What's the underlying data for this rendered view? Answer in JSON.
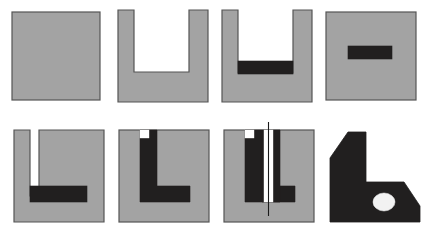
{
  "figure": {
    "width": 426,
    "height": 231,
    "background_color": "#ffffff",
    "rows": 2,
    "columns": 4
  },
  "colors": {
    "material_gray": "#a3a3a3",
    "cut_black": "#211f1f",
    "outline": "#555555",
    "void_white": "#ffffff",
    "hole_white": "#f2f2f2",
    "centerline": "#1a1a1a"
  },
  "panels": [
    {
      "index": 1,
      "name": "solid-block",
      "label": "",
      "shape": "square",
      "features": []
    },
    {
      "index": 2,
      "name": "open-slot-block",
      "label": "",
      "shape": "u-channel",
      "features": [
        "through-slot-open-top"
      ]
    },
    {
      "index": 3,
      "name": "slot-with-black-floor",
      "label": "",
      "shape": "u-channel",
      "features": [
        "through-slot-open-top",
        "black-floor-bar"
      ]
    },
    {
      "index": 4,
      "name": "hidden-internal-bar",
      "label": "",
      "shape": "square",
      "features": [
        "internal-black-bar"
      ]
    },
    {
      "index": 5,
      "name": "narrow-slot-with-bar",
      "label": "",
      "shape": "square",
      "features": [
        "narrow-vertical-slot",
        "black-horizontal-bar"
      ]
    },
    {
      "index": 6,
      "name": "l-shaped-black-cut",
      "label": "",
      "shape": "square",
      "features": [
        "black-l-section",
        "top-notch"
      ]
    },
    {
      "index": 7,
      "name": "sectioned-with-centerline",
      "label": "",
      "shape": "square",
      "features": [
        "black-l-section",
        "white-vertical-slot",
        "centerline"
      ]
    },
    {
      "index": 8,
      "name": "finished-bracket",
      "label": "",
      "shape": "chamfered-l-bracket",
      "features": [
        "chamfer-top-left",
        "chamfer-bottom-right",
        "round-hole"
      ]
    }
  ],
  "geometry": {
    "panel1": {
      "x": 12,
      "y": 12,
      "w": 88,
      "h": 88
    },
    "panel2": {
      "x": 118,
      "y": 10,
      "w": 90,
      "h": 92,
      "slot_left": 134,
      "slot_right": 189,
      "slot_bottom": 72
    },
    "panel3": {
      "x": 222,
      "y": 10,
      "w": 90,
      "h": 92,
      "slot_left": 238,
      "slot_right": 293,
      "slot_bottom": 73,
      "bar_top": 61
    },
    "panel4": {
      "x": 326,
      "y": 12,
      "w": 90,
      "h": 88,
      "bar_x": 348,
      "bar_y": 58,
      "bar_w": 44,
      "bar_h": 13
    },
    "panel5": {
      "x": 14,
      "y": 130,
      "w": 90,
      "h": 92,
      "slot_left": 30,
      "slot_right": 39,
      "slot_bottom": 196,
      "bar_x": 30,
      "bar_y": 186,
      "bar_w": 57,
      "bar_h": 16
    },
    "panel6": {
      "x": 119,
      "y": 130,
      "w": 90,
      "h": 92,
      "stem_left": 140,
      "stem_right": 157,
      "arm_bottom": 202,
      "arm_right": 190,
      "notch_w": 8,
      "notch_h": 8
    },
    "panel7": {
      "x": 224,
      "y": 130,
      "w": 90,
      "h": 92,
      "centerline_x": 270
    },
    "panel8": {
      "x": 330,
      "y": 132,
      "w": 92,
      "h": 90,
      "hole_cx": 384,
      "hole_cy": 192,
      "hole_rx": 11,
      "hole_ry": 9
    }
  }
}
